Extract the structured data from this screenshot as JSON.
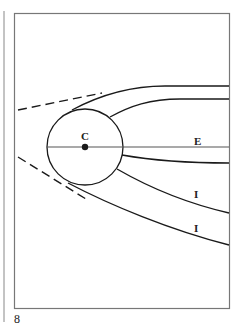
{
  "figure": {
    "labels": {
      "center": "C",
      "equator": "E",
      "upper_I": "I",
      "lower_I": "I"
    },
    "colors": {
      "stroke": "#1a1a1a",
      "frame": "#777777",
      "axis": "#555555",
      "background": "#ffffff"
    }
  },
  "page": {
    "number": "8"
  }
}
